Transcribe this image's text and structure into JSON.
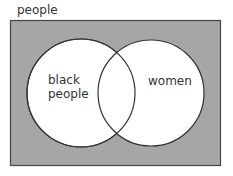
{
  "universe": {
    "label": "people",
    "fill": "#a6a6a6",
    "border": "#444444"
  },
  "sets": [
    {
      "label_line1": "black",
      "label_line2": "people",
      "fill": "#ffffff"
    },
    {
      "label": "women",
      "fill": "#ffffff"
    }
  ]
}
